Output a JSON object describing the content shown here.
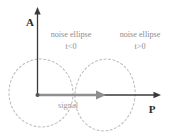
{
  "figure": {
    "title_present": false,
    "background_color": "#ffffff",
    "axes": {
      "vertical": {
        "label": "A",
        "label_x": 30,
        "label_y": 24,
        "x": 37.5,
        "y_top": 10,
        "y_bottom": 95,
        "color": "#3a3a3a",
        "arrow": "up"
      },
      "horizontal": {
        "label": "P",
        "label_x": 152,
        "label_y": 112,
        "y": 95,
        "x_left": 37.5,
        "x_right": 160,
        "color": "#3a3a3a",
        "arrow": "right"
      },
      "origin": {
        "x": 37.5,
        "y": 95
      }
    },
    "signal_vector": {
      "label": "signal",
      "label_x": 68,
      "label_y": 107,
      "x_start": 37.5,
      "x_end": 104,
      "y": 95,
      "color": "#8e8e8e"
    },
    "ellipses": [
      {
        "name": "noise-ellipse-negative-t",
        "label_line1": "noise ellipse",
        "label_line2": "t<0",
        "label_x": 71,
        "label_y1": 36,
        "label_y2": 48,
        "cx": 41,
        "cy": 93,
        "rx": 32,
        "ry": 34,
        "rotation_deg": -8,
        "color": "#b9b9b9",
        "style": "dashed"
      },
      {
        "name": "noise-ellipse-positive-t",
        "label_line1": "noise ellipse",
        "label_line2": "t>0",
        "label_x": 139,
        "label_y1": 36,
        "label_y2": 48,
        "cx": 105,
        "cy": 95,
        "rx": 30,
        "ry": 36,
        "rotation_deg": 8,
        "color": "#b9b9b9",
        "style": "dashed"
      }
    ],
    "colors": {
      "axis": "#3a3a3a",
      "signal": "#8e8e8e",
      "ellipse": "#b9b9b9",
      "note_text": "#8d8d8d",
      "axis_text": "#2b2b2b"
    }
  }
}
